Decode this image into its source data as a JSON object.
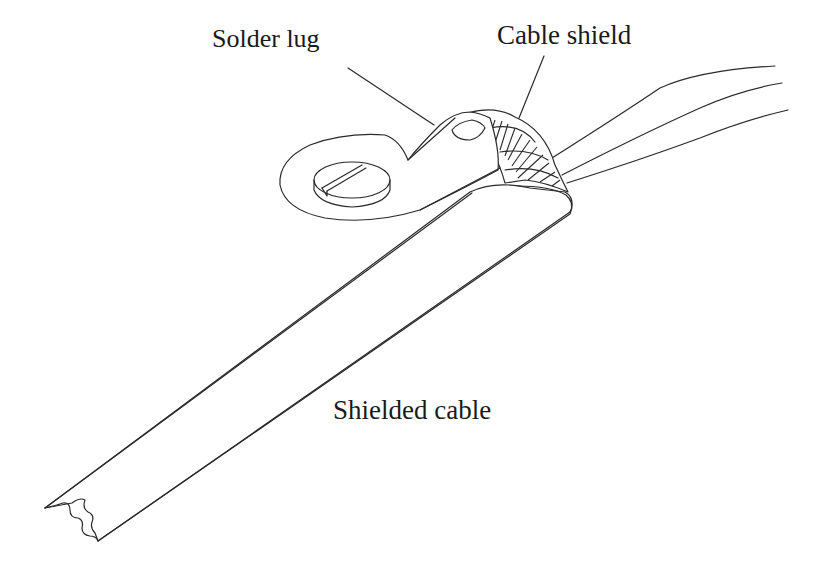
{
  "diagram": {
    "type": "technical-illustration",
    "labels": {
      "solder_lug": "Solder lug",
      "cable_shield": "Cable shield",
      "shielded_cable": "Shielded cable"
    },
    "components": [
      {
        "id": "solder-lug",
        "label": "Solder lug",
        "description": "Ring terminal with slotted screw head, crimped onto braided shield"
      },
      {
        "id": "cable-shield",
        "label": "Cable shield",
        "description": "Braided shield pulled back and twisted into lug"
      },
      {
        "id": "shielded-cable",
        "label": "Shielded cable",
        "description": "Flat jacketed cable running diagonally, torn end at lower left"
      },
      {
        "id": "conductors",
        "label": "",
        "description": "Three inner conductors emerging to the upper right"
      }
    ],
    "colors": {
      "line": "#2a2a2a",
      "background": "#ffffff"
    }
  }
}
